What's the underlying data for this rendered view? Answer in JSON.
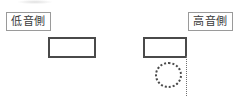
{
  "diagram": {
    "background_color": "#ffffff",
    "labels": [
      {
        "id": "low",
        "text": "低音側",
        "box_border_color": "#9a9a9a",
        "text_color": "#3b3b3b"
      },
      {
        "id": "high",
        "text": "高音側",
        "box_border_color": "#9a9a9a",
        "text_color": "#3b3b3b"
      }
    ],
    "shapes": {
      "rect_low": {
        "stroke_color": "#4a4a4a",
        "fill_color": "#ffffff",
        "style": "solid"
      },
      "rect_high": {
        "stroke_color": "#4a4a4a",
        "fill_color": "#ffffff",
        "style": "solid"
      },
      "circle": {
        "stroke_color": "#4a4a4a",
        "fill_color": "transparent",
        "style": "dotted"
      },
      "guide_line": {
        "stroke_color": "#6f6f6f",
        "style": "dotted",
        "orientation": "vertical"
      }
    }
  }
}
